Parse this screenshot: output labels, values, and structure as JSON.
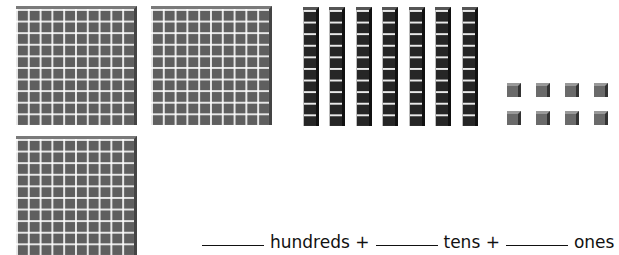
{
  "blocks": {
    "hundreds_count": 3,
    "tens_count": 7,
    "ones_count": 8
  },
  "caption": {
    "hundreds_label": "hundreds +",
    "tens_label": "tens +",
    "ones_label": "ones"
  },
  "colors": {
    "flat": "#5f5f5f",
    "rod": "#262626",
    "cube": "#6a6a6a"
  }
}
